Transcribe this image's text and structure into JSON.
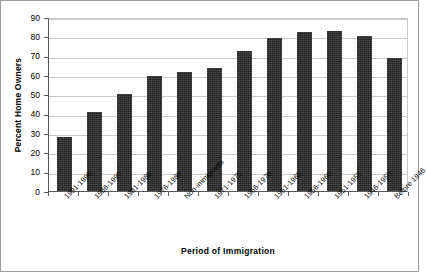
{
  "chart_data": {
    "type": "bar",
    "title": "",
    "xlabel": "Period of Immigration",
    "ylabel": "Percent Home Owners",
    "ylim": [
      0,
      90
    ],
    "ytick_step": 10,
    "yticks": [
      0,
      10,
      20,
      30,
      40,
      50,
      60,
      70,
      80,
      90
    ],
    "grid": true,
    "legend": false,
    "bar_color": "#222222",
    "categories": [
      "1991-1996",
      "1986-1990",
      "1981-1985",
      "1976-1980",
      "Non-immigrants",
      "1971-1975",
      "1966-1970",
      "1961-1965",
      "1956-1960",
      "1951-1955",
      "1946-1950",
      "Before 1946"
    ],
    "values": [
      28,
      41,
      50,
      59.5,
      61.5,
      63.5,
      72.5,
      79,
      82,
      83,
      80,
      69
    ],
    "series": [
      {
        "name": "Percent Home Owners",
        "values": [
          28,
          41,
          50,
          59.5,
          61.5,
          63.5,
          72.5,
          79,
          82,
          83,
          80,
          69
        ]
      }
    ]
  },
  "footnote": ""
}
